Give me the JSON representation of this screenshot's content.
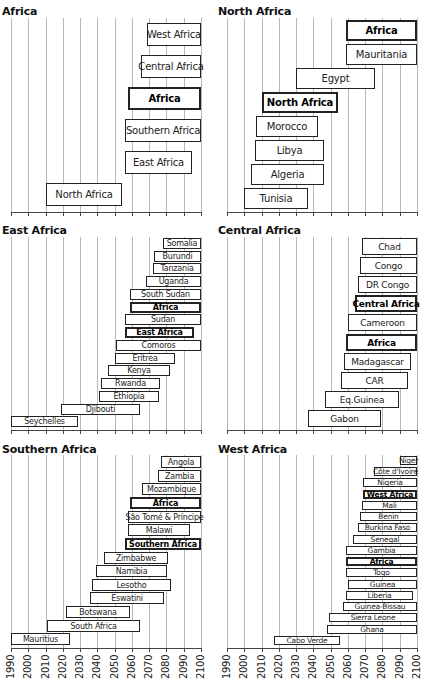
{
  "chart_data": [
    {
      "type": "bar",
      "orientation": "horizontal-range",
      "title": "Africa",
      "x_range": [
        1990,
        2100
      ],
      "xticks": [
        1990,
        2000,
        2010,
        2020,
        2030,
        2040,
        2050,
        2060,
        2070,
        2080,
        2090,
        2100
      ],
      "grid": true,
      "bars": [
        {
          "label": "West Africa",
          "start": 2069,
          "end": 2100,
          "bold": false
        },
        {
          "label": "Central Africa",
          "start": 2065,
          "end": 2100,
          "bold": false
        },
        {
          "label": "Africa",
          "start": 2058,
          "end": 2100,
          "bold": true
        },
        {
          "label": "Southern Africa",
          "start": 2056,
          "end": 2100,
          "bold": false
        },
        {
          "label": "East Africa",
          "start": 2056,
          "end": 2095,
          "bold": false
        },
        {
          "label": "North Africa",
          "start": 2010,
          "end": 2054,
          "bold": false
        }
      ]
    },
    {
      "type": "bar",
      "orientation": "horizontal-range",
      "title": "North Africa",
      "x_range": [
        1990,
        2100
      ],
      "xticks": [
        1990,
        2000,
        2010,
        2020,
        2030,
        2040,
        2050,
        2060,
        2070,
        2080,
        2090,
        2100
      ],
      "grid": true,
      "bars": [
        {
          "label": "Africa",
          "start": 2059,
          "end": 2100,
          "bold": true
        },
        {
          "label": "Mauritania",
          "start": 2059,
          "end": 2100,
          "bold": false
        },
        {
          "label": "Egypt",
          "start": 2030,
          "end": 2076,
          "bold": false
        },
        {
          "label": "North Africa",
          "start": 2010,
          "end": 2054,
          "bold": true
        },
        {
          "label": "Morocco",
          "start": 2007,
          "end": 2043,
          "bold": false
        },
        {
          "label": "Libya",
          "start": 2006,
          "end": 2046,
          "bold": false
        },
        {
          "label": "Algeria",
          "start": 2004,
          "end": 2046,
          "bold": false
        },
        {
          "label": "Tunisia",
          "start": 2000,
          "end": 2037,
          "bold": false
        }
      ]
    },
    {
      "type": "bar",
      "orientation": "horizontal-range",
      "title": "East Africa",
      "x_range": [
        1990,
        2100
      ],
      "xticks": [
        1990,
        2000,
        2010,
        2020,
        2030,
        2040,
        2050,
        2060,
        2070,
        2080,
        2090,
        2100
      ],
      "grid": true,
      "bars": [
        {
          "label": "Somalia",
          "start": 2078,
          "end": 2100,
          "bold": false
        },
        {
          "label": "Burundi",
          "start": 2073,
          "end": 2100,
          "bold": false
        },
        {
          "label": "Tanzania",
          "start": 2072,
          "end": 2100,
          "bold": false
        },
        {
          "label": "Uganda",
          "start": 2068,
          "end": 2100,
          "bold": false
        },
        {
          "label": "South Sudan",
          "start": 2059,
          "end": 2100,
          "bold": false
        },
        {
          "label": "Africa",
          "start": 2059,
          "end": 2100,
          "bold": true
        },
        {
          "label": "Sudan",
          "start": 2056,
          "end": 2100,
          "bold": false
        },
        {
          "label": "East Africa",
          "start": 2056,
          "end": 2096,
          "bold": true
        },
        {
          "label": "Comoros",
          "start": 2051,
          "end": 2100,
          "bold": false
        },
        {
          "label": "Eritrea",
          "start": 2050,
          "end": 2085,
          "bold": false
        },
        {
          "label": "Kenya",
          "start": 2046,
          "end": 2082,
          "bold": false
        },
        {
          "label": "Rwanda",
          "start": 2042,
          "end": 2076,
          "bold": false
        },
        {
          "label": "Ethiopia",
          "start": 2041,
          "end": 2076,
          "bold": false
        },
        {
          "label": "Djibouti",
          "start": 2019,
          "end": 2065,
          "bold": false
        },
        {
          "label": "Seychelles",
          "start": 1990,
          "end": 2029,
          "bold": false
        }
      ]
    },
    {
      "type": "bar",
      "orientation": "horizontal-range",
      "title": "Central Africa",
      "x_range": [
        1990,
        2100
      ],
      "xticks": [
        1990,
        2000,
        2010,
        2020,
        2030,
        2040,
        2050,
        2060,
        2070,
        2080,
        2090,
        2100
      ],
      "grid": true,
      "bars": [
        {
          "label": "Chad",
          "start": 2068,
          "end": 2100,
          "bold": false
        },
        {
          "label": "Congo",
          "start": 2067,
          "end": 2100,
          "bold": false
        },
        {
          "label": "DR Congo",
          "start": 2066,
          "end": 2100,
          "bold": false
        },
        {
          "label": "Central Africa",
          "start": 2064,
          "end": 2100,
          "bold": true
        },
        {
          "label": "Cameroon",
          "start": 2060,
          "end": 2100,
          "bold": false
        },
        {
          "label": "Africa",
          "start": 2059,
          "end": 2100,
          "bold": true
        },
        {
          "label": "Madagascar",
          "start": 2058,
          "end": 2097,
          "bold": false
        },
        {
          "label": "CAR",
          "start": 2056,
          "end": 2095,
          "bold": false
        },
        {
          "label": "Eq.Guinea",
          "start": 2047,
          "end": 2090,
          "bold": false
        },
        {
          "label": "Gabon",
          "start": 2037,
          "end": 2079,
          "bold": false
        }
      ]
    },
    {
      "type": "bar",
      "orientation": "horizontal-range",
      "title": "Southern Africa",
      "x_range": [
        1990,
        2100
      ],
      "xticks": [
        1990,
        2000,
        2010,
        2020,
        2030,
        2040,
        2050,
        2060,
        2070,
        2080,
        2090,
        2100
      ],
      "grid": true,
      "bars": [
        {
          "label": "Angola",
          "start": 2077,
          "end": 2100,
          "bold": false
        },
        {
          "label": "Zambia",
          "start": 2075,
          "end": 2100,
          "bold": false
        },
        {
          "label": "Mozambique",
          "start": 2066,
          "end": 2100,
          "bold": false
        },
        {
          "label": "Africa",
          "start": 2059,
          "end": 2100,
          "bold": true
        },
        {
          "label": "São Tomé & Príncipe",
          "start": 2058,
          "end": 2100,
          "bold": false
        },
        {
          "label": "Malawi",
          "start": 2058,
          "end": 2094,
          "bold": false
        },
        {
          "label": "Southern Africa",
          "start": 2056,
          "end": 2100,
          "bold": true
        },
        {
          "label": "Zimbabwe",
          "start": 2044,
          "end": 2081,
          "bold": false
        },
        {
          "label": "Namibia",
          "start": 2039,
          "end": 2080,
          "bold": false
        },
        {
          "label": "Lesotho",
          "start": 2037,
          "end": 2083,
          "bold": false
        },
        {
          "label": "Eswatini",
          "start": 2036,
          "end": 2079,
          "bold": false
        },
        {
          "label": "Botswana",
          "start": 2022,
          "end": 2059,
          "bold": false
        },
        {
          "label": "South Africa",
          "start": 2011,
          "end": 2065,
          "bold": false
        },
        {
          "label": "Mauritius",
          "start": 1990,
          "end": 2024,
          "bold": false
        }
      ]
    },
    {
      "type": "bar",
      "orientation": "horizontal-range",
      "title": "West Africa",
      "x_range": [
        1990,
        2100
      ],
      "xticks": [
        1990,
        2000,
        2010,
        2020,
        2030,
        2040,
        2050,
        2060,
        2070,
        2080,
        2090,
        2100
      ],
      "grid": true,
      "bars": [
        {
          "label": "Niger",
          "start": 2090,
          "end": 2100,
          "bold": false
        },
        {
          "label": "Côte d'Ivoire",
          "start": 2075,
          "end": 2100,
          "bold": false
        },
        {
          "label": "Nigeria",
          "start": 2069,
          "end": 2100,
          "bold": false
        },
        {
          "label": "West Africa",
          "start": 2069,
          "end": 2100,
          "bold": true
        },
        {
          "label": "Mali",
          "start": 2068,
          "end": 2100,
          "bold": false
        },
        {
          "label": "Benin",
          "start": 2067,
          "end": 2100,
          "bold": false
        },
        {
          "label": "Burkina Faso",
          "start": 2066,
          "end": 2100,
          "bold": false
        },
        {
          "label": "Senegal",
          "start": 2063,
          "end": 2100,
          "bold": false
        },
        {
          "label": "Gambia",
          "start": 2059,
          "end": 2100,
          "bold": false
        },
        {
          "label": "Africa",
          "start": 2059,
          "end": 2100,
          "bold": true
        },
        {
          "label": "Togo",
          "start": 2059,
          "end": 2100,
          "bold": false
        },
        {
          "label": "Guinea",
          "start": 2060,
          "end": 2100,
          "bold": false
        },
        {
          "label": "Liberia",
          "start": 2059,
          "end": 2098,
          "bold": false
        },
        {
          "label": "Guinea-Bissau",
          "start": 2057,
          "end": 2100,
          "bold": false
        },
        {
          "label": "Sierra Leone",
          "start": 2049,
          "end": 2100,
          "bold": false
        },
        {
          "label": "Ghana",
          "start": 2048,
          "end": 2100,
          "bold": false
        },
        {
          "label": "Cabo Verde",
          "start": 2017,
          "end": 2055,
          "bold": false
        }
      ]
    }
  ],
  "layout": {
    "panels": [
      {
        "x0": 11,
        "x1": 201,
        "title_y": 5,
        "top": 18,
        "axis_y": 212,
        "font": 10,
        "bar_h": 23,
        "show_xlabels": false
      },
      {
        "x0": 227,
        "x1": 417,
        "title_y": 5,
        "top": 18,
        "axis_y": 212,
        "font": 10,
        "bar_h": 21,
        "show_xlabels": false
      },
      {
        "x0": 11,
        "x1": 201,
        "title_y": 224,
        "top": 237,
        "axis_y": 430,
        "font": 8,
        "bar_h": 12,
        "show_xlabels": false
      },
      {
        "x0": 227,
        "x1": 417,
        "title_y": 224,
        "top": 237,
        "axis_y": 430,
        "font": 9,
        "bar_h": 17,
        "show_xlabels": false
      },
      {
        "x0": 11,
        "x1": 201,
        "title_y": 443,
        "top": 455,
        "axis_y": 648,
        "font": 8,
        "bar_h": 12,
        "show_xlabels": true
      },
      {
        "x0": 227,
        "x1": 417,
        "title_y": 443,
        "top": 455,
        "axis_y": 648,
        "font": 7.5,
        "bar_h": 10,
        "show_xlabels": true
      }
    ]
  }
}
